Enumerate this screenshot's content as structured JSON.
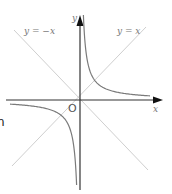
{
  "diagram": {
    "labels": {
      "y_axis": "y",
      "x_axis": "x",
      "origin": "O",
      "line_neg": "y = −x",
      "line_pos": "y = x"
    },
    "curve": {
      "equation": "y = 1/x",
      "branches": [
        "first-quadrant",
        "third-quadrant"
      ]
    },
    "edge_fragment": "n",
    "colors": {
      "axis": "#222222",
      "curve": "#777777",
      "diagonal": "#cccccc",
      "label": "#777777"
    }
  }
}
